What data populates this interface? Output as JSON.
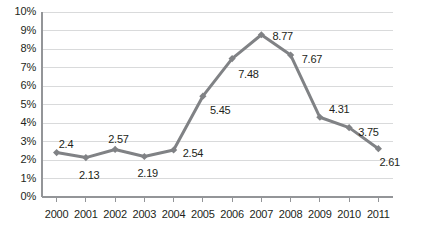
{
  "chart_data": {
    "type": "line",
    "title": "",
    "xlabel": "",
    "ylabel": "",
    "categories": [
      "2000",
      "2001",
      "2002",
      "2003",
      "2004",
      "2005",
      "2006",
      "2007",
      "2008",
      "2009",
      "2010",
      "2011"
    ],
    "values": [
      2.4,
      2.13,
      2.57,
      2.19,
      2.54,
      5.45,
      7.48,
      8.77,
      7.67,
      4.31,
      3.75,
      2.61
    ],
    "point_labels": [
      "2.4",
      "2.13",
      "2.57",
      "2.19",
      "2.54",
      "5.45",
      "7.48",
      "8.77",
      "7.67",
      "4.31",
      "3.75",
      "2.61"
    ],
    "ylim": [
      0,
      10
    ],
    "ytick_labels": [
      "10%",
      "9%",
      "8%",
      "7%",
      "6%",
      "5%",
      "4%",
      "3%",
      "2%",
      "1%",
      "0%"
    ],
    "ytick_values": [
      10,
      9,
      8,
      7,
      6,
      5,
      4,
      3,
      2,
      1,
      0
    ],
    "grid": true,
    "legend": "none",
    "series_color": "#808285",
    "grid_color": "#d9dadb",
    "axis_color": "#939598",
    "text_color": "#231f20",
    "marker": "diamond",
    "label_offsets": [
      {
        "dx": 2,
        "dy": -14
      },
      {
        "dx": -7,
        "dy": 12
      },
      {
        "dx": -7,
        "dy": -15
      },
      {
        "dx": -7,
        "dy": 12
      },
      {
        "dx": 9,
        "dy": -2
      },
      {
        "dx": 7,
        "dy": 9
      },
      {
        "dx": 6,
        "dy": 10
      },
      {
        "dx": 11,
        "dy": -4
      },
      {
        "dx": 11,
        "dy": -1
      },
      {
        "dx": 9,
        "dy": -13
      },
      {
        "dx": 9,
        "dy": -1
      },
      {
        "dx": 1,
        "dy": 8
      }
    ]
  }
}
